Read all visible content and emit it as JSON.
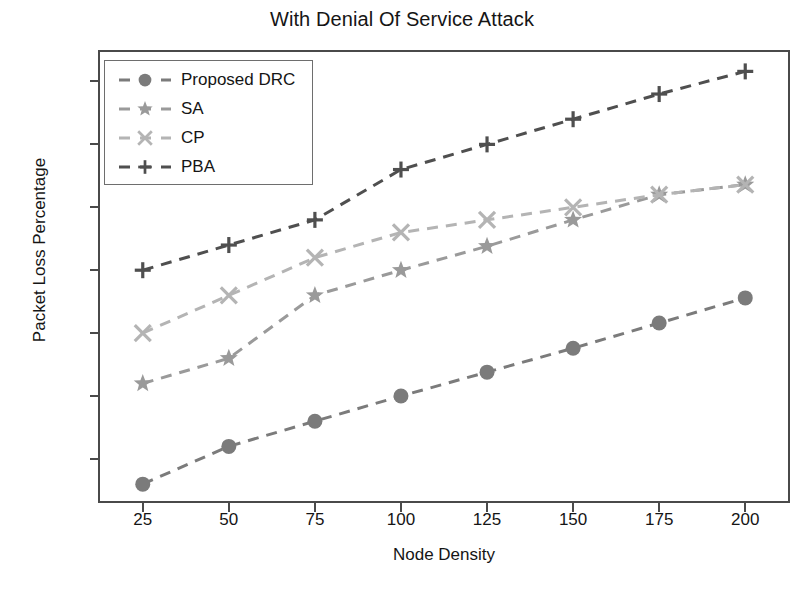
{
  "chart_data": {
    "type": "line",
    "title": "With Denial Of Service Attack",
    "xlabel": "Node Density",
    "ylabel": "Packet Loss Percentage",
    "x": [
      25,
      50,
      75,
      100,
      125,
      150,
      175,
      200
    ],
    "xticks": [
      "25",
      "50",
      "75",
      "100",
      "125",
      "150",
      "175",
      "200"
    ],
    "yticks": [
      "10",
      "15",
      "20",
      "25",
      "30",
      "35",
      "40"
    ],
    "ytick_values": [
      10,
      15,
      20,
      25,
      30,
      35,
      40
    ],
    "xlim": [
      12,
      213
    ],
    "ylim": [
      6.5,
      42.5
    ],
    "grid": false,
    "legend_position": "upper left",
    "series": [
      {
        "name": "Proposed DRC",
        "marker": "circle",
        "color": "#7b7b7b",
        "linestyle": "dashed",
        "values": [
          8.0,
          11.0,
          13.0,
          15.0,
          16.9,
          18.8,
          20.8,
          22.8
        ]
      },
      {
        "name": "SA",
        "marker": "star",
        "color": "#9a9a9a",
        "linestyle": "dashed",
        "values": [
          16.0,
          18.0,
          23.0,
          25.0,
          26.9,
          29.0,
          31.0,
          31.8
        ]
      },
      {
        "name": "CP",
        "marker": "x",
        "color": "#b4b4b4",
        "linestyle": "dashed",
        "values": [
          20.0,
          23.0,
          26.0,
          28.0,
          29.0,
          30.0,
          31.0,
          31.8
        ]
      },
      {
        "name": "PBA",
        "marker": "plus",
        "color": "#4f4f4f",
        "linestyle": "dashed",
        "values": [
          25.0,
          27.0,
          29.0,
          33.0,
          35.0,
          37.0,
          39.0,
          40.8
        ]
      }
    ]
  },
  "legend": {
    "entries": [
      {
        "label": "Proposed DRC"
      },
      {
        "label": "SA"
      },
      {
        "label": "CP"
      },
      {
        "label": "PBA"
      }
    ]
  }
}
